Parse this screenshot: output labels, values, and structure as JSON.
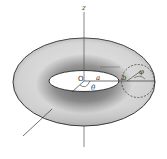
{
  "diagram": {
    "labels": {
      "z_axis": "z",
      "origin": "O",
      "major_radius": "a",
      "minor_radius": "b",
      "theta": "θ",
      "phi": "φ"
    },
    "colors": {
      "surface_light": "#e8e8e8",
      "surface_dark": "#6a6a6a",
      "outline": "#222222",
      "background": "#ffffff"
    }
  }
}
